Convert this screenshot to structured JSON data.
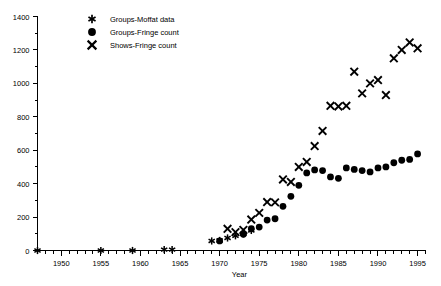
{
  "chart_data": {
    "type": "scatter",
    "title": "",
    "xlabel": "Year",
    "ylabel": "",
    "xlim": [
      1947,
      1996
    ],
    "ylim": [
      0,
      1400
    ],
    "grid": false,
    "legend_position": "top-left",
    "x_ticks_major": [
      1950,
      1955,
      1960,
      1965,
      1970,
      1975,
      1980,
      1985,
      1990,
      1995
    ],
    "x_tick_labels": [
      "1950",
      "1955",
      "1960",
      "1965",
      "1970",
      "1975",
      "1980",
      "1985",
      "1990",
      "1995"
    ],
    "x_minor_step": 1,
    "y_ticks_major": [
      0,
      200,
      400,
      600,
      800,
      1000,
      1200,
      1400
    ],
    "y_tick_labels": [
      "0",
      "200",
      "400",
      "600",
      "800",
      "1000",
      "1200",
      "1400"
    ],
    "series": [
      {
        "name": "Groups-Moffat data",
        "marker": "asterisk",
        "color": "#000000",
        "points": [
          {
            "x": 1947,
            "y": 0
          },
          {
            "x": 1955,
            "y": 0
          },
          {
            "x": 1959,
            "y": 0
          },
          {
            "x": 1963,
            "y": 5
          },
          {
            "x": 1964,
            "y": 5
          },
          {
            "x": 1969,
            "y": 57
          },
          {
            "x": 1970,
            "y": 60
          },
          {
            "x": 1971,
            "y": 75
          },
          {
            "x": 1972,
            "y": 88
          },
          {
            "x": 1973,
            "y": 100
          },
          {
            "x": 1974,
            "y": 120
          }
        ]
      },
      {
        "name": "Groups-Fringe count",
        "marker": "circle",
        "color": "#000000",
        "points": [
          {
            "x": 1970,
            "y": 57
          },
          {
            "x": 1973,
            "y": 97
          },
          {
            "x": 1974,
            "y": 130
          },
          {
            "x": 1975,
            "y": 140
          },
          {
            "x": 1976,
            "y": 182
          },
          {
            "x": 1977,
            "y": 190
          },
          {
            "x": 1978,
            "y": 264
          },
          {
            "x": 1979,
            "y": 324
          },
          {
            "x": 1980,
            "y": 390
          },
          {
            "x": 1981,
            "y": 464
          },
          {
            "x": 1982,
            "y": 482
          },
          {
            "x": 1983,
            "y": 478
          },
          {
            "x": 1984,
            "y": 440
          },
          {
            "x": 1985,
            "y": 432
          },
          {
            "x": 1986,
            "y": 494
          },
          {
            "x": 1987,
            "y": 485
          },
          {
            "x": 1988,
            "y": 478
          },
          {
            "x": 1989,
            "y": 470
          },
          {
            "x": 1990,
            "y": 494
          },
          {
            "x": 1991,
            "y": 500
          },
          {
            "x": 1992,
            "y": 525
          },
          {
            "x": 1993,
            "y": 540
          },
          {
            "x": 1994,
            "y": 545
          },
          {
            "x": 1995,
            "y": 578
          }
        ]
      },
      {
        "name": "Shows-Fringe count",
        "marker": "cross",
        "color": "#000000",
        "points": [
          {
            "x": 1971,
            "y": 130
          },
          {
            "x": 1972,
            "y": 110
          },
          {
            "x": 1973,
            "y": 123
          },
          {
            "x": 1974,
            "y": 185
          },
          {
            "x": 1975,
            "y": 225
          },
          {
            "x": 1976,
            "y": 290
          },
          {
            "x": 1977,
            "y": 288
          },
          {
            "x": 1978,
            "y": 425
          },
          {
            "x": 1979,
            "y": 410
          },
          {
            "x": 1980,
            "y": 500
          },
          {
            "x": 1981,
            "y": 530
          },
          {
            "x": 1982,
            "y": 625
          },
          {
            "x": 1983,
            "y": 715
          },
          {
            "x": 1984,
            "y": 866
          },
          {
            "x": 1985,
            "y": 862
          },
          {
            "x": 1986,
            "y": 866
          },
          {
            "x": 1987,
            "y": 1070
          },
          {
            "x": 1988,
            "y": 940
          },
          {
            "x": 1989,
            "y": 1000
          },
          {
            "x": 1990,
            "y": 1020
          },
          {
            "x": 1991,
            "y": 930
          },
          {
            "x": 1992,
            "y": 1150
          },
          {
            "x": 1993,
            "y": 1200
          },
          {
            "x": 1994,
            "y": 1245
          },
          {
            "x": 1995,
            "y": 1210
          }
        ]
      }
    ]
  },
  "legend": {
    "items": [
      {
        "label": "Groups-Moffat data",
        "marker": "asterisk"
      },
      {
        "label": "Groups-Fringe count",
        "marker": "circle"
      },
      {
        "label": "Shows-Fringe count",
        "marker": "cross"
      }
    ]
  }
}
